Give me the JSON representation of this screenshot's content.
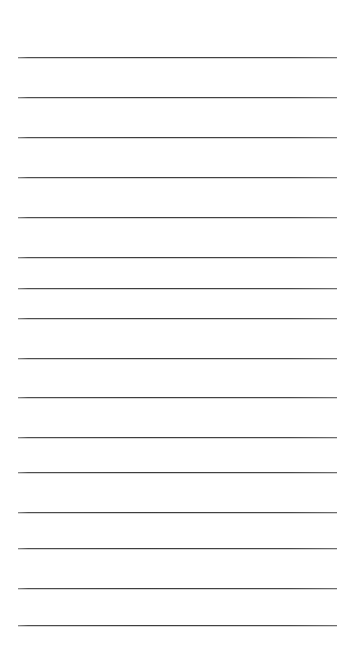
{
  "document": {
    "type": "ruled-paper",
    "title": "",
    "text_content": "",
    "page_width": 354,
    "page_height": 655,
    "background_color": "#ffffff",
    "rule_color": "#4a4a4a",
    "rule_thickness": 1,
    "rule_left": 18,
    "rule_right": 337,
    "rule_width": 319,
    "first_rule_y": 57,
    "rule_spacing": 40.5,
    "rule_count": 15,
    "rules": [
      {
        "index": 1,
        "y": 57
      },
      {
        "index": 2,
        "y": 97
      },
      {
        "index": 3,
        "y": 137
      },
      {
        "index": 4,
        "y": 177
      },
      {
        "index": 5,
        "y": 217
      },
      {
        "index": 6,
        "y": 257
      },
      {
        "index": 7,
        "y": 288
      },
      {
        "index": 8,
        "y": 318
      },
      {
        "index": 9,
        "y": 358
      },
      {
        "index": 10,
        "y": 397
      },
      {
        "index": 11,
        "y": 437
      },
      {
        "index": 12,
        "y": 472
      },
      {
        "index": 13,
        "y": 512
      },
      {
        "index": 14,
        "y": 548
      },
      {
        "index": 15,
        "y": 588
      },
      {
        "index": 16,
        "y": 625
      }
    ]
  }
}
